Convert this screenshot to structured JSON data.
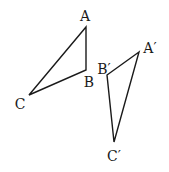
{
  "diagram": {
    "triangles": [
      {
        "name": "ABC",
        "vertices": [
          {
            "label": "A",
            "x": 86,
            "y": 27,
            "lx": 85,
            "ly": 21
          },
          {
            "label": "B",
            "x": 86,
            "y": 70,
            "lx": 89,
            "ly": 87
          },
          {
            "label": "C",
            "x": 29,
            "y": 95,
            "lx": 20,
            "ly": 109
          }
        ]
      },
      {
        "name": "A'B'C'",
        "vertices": [
          {
            "label": "A′",
            "x": 139,
            "y": 52,
            "lx": 150,
            "ly": 53
          },
          {
            "label": "B′",
            "x": 107,
            "y": 75,
            "lx": 104,
            "ly": 74
          },
          {
            "label": "C′",
            "x": 114,
            "y": 142,
            "lx": 114,
            "ly": 161
          }
        ]
      }
    ],
    "stroke_color": "#1a1a1a",
    "background": "#ffffff"
  }
}
